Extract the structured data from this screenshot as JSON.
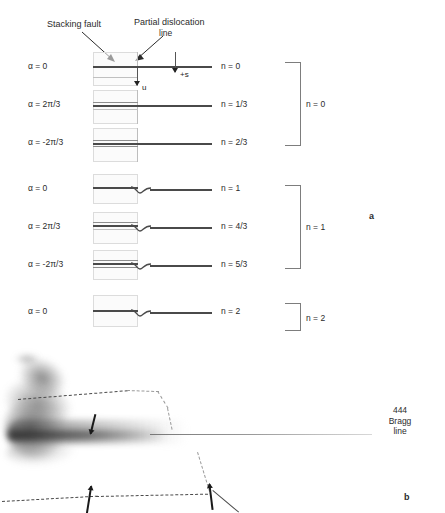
{
  "figure": {
    "panel_a_letter": "a",
    "panel_b_letter": "b"
  },
  "panel_a": {
    "annotations": {
      "stacking_fault": "Stacking fault",
      "partial_dislocation_1": "Partial dislocation",
      "partial_dislocation_2": "line",
      "displacement_marker": "u",
      "deviation_marker": "+s"
    },
    "rows": [
      {
        "alpha": "α = 0",
        "n": "n = 0"
      },
      {
        "alpha": "α = 2π/3",
        "n": "n = 1/3"
      },
      {
        "alpha": "α =  -2π/3",
        "n": "n = 2/3"
      },
      {
        "alpha": "α = 0",
        "n": "n = 1"
      },
      {
        "alpha": "α = 2π/3",
        "n": "n = 4/3"
      },
      {
        "alpha": "α = -2π/3",
        "n": "n = 5/3"
      },
      {
        "alpha": "α = 0",
        "n": "n = 2"
      }
    ],
    "groups": [
      {
        "label": "n = 0"
      },
      {
        "label": "n = 1"
      },
      {
        "label": "n = 2"
      }
    ]
  },
  "panel_b": {
    "bragg_label_line1": "444",
    "bragg_label_line2": "Bragg",
    "bragg_label_line3": "line"
  },
  "colors": {
    "ink": "#2b2b2b",
    "line": "#4a4a4a",
    "fault_box_border": "#dcdcdc",
    "brace": "#7d7d7d"
  }
}
